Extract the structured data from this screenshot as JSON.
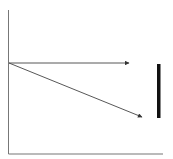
{
  "diagram": {
    "width": 173,
    "height": 159,
    "background": "#ffffff",
    "axes": {
      "color": "#777777",
      "y_axis": {
        "x": 8.5,
        "y_top": 10,
        "y_bottom": 154
      },
      "x_axis": {
        "y": 154,
        "x_left": 8.5,
        "x_right": 163
      }
    },
    "arrows": [
      {
        "name": "horizontal-arrow",
        "from": [
          9,
          63
        ],
        "to": [
          129,
          63
        ],
        "color": "#444444"
      },
      {
        "name": "diagonal-arrow",
        "from": [
          9,
          63
        ],
        "to": [
          142,
          117
        ],
        "color": "#444444"
      }
    ],
    "bar": {
      "x": 157,
      "y": 64,
      "width": 3.5,
      "height": 54,
      "color": "#111111"
    }
  }
}
